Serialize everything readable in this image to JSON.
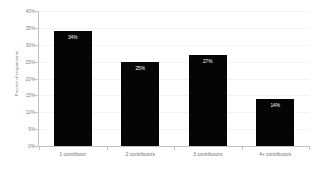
{
  "chart_data": {
    "type": "bar",
    "title": "",
    "subtitle": "",
    "xlabel": "",
    "ylabel": "Percent of respondents",
    "categories": [
      "1 contributor",
      "2 contributors",
      "3 contributors",
      "4+ contributors"
    ],
    "values": [
      34,
      25,
      27,
      14
    ],
    "value_labels": [
      "34%",
      "25%",
      "27%",
      "14%"
    ],
    "ylim": [
      0,
      40
    ],
    "ytick_values": [
      0,
      5,
      10,
      15,
      20,
      25,
      30,
      35,
      40
    ],
    "ytick_labels": [
      "0%",
      "5%",
      "10%",
      "15%",
      "20%",
      "25%",
      "30%",
      "35%",
      "40%"
    ],
    "grid": true,
    "legend": false,
    "legend_position": "none",
    "bar_color": "#050505",
    "value_label_color": "#ffffff",
    "gridline_color": "#f4f4f4",
    "axis_color": "#c2c2c2",
    "tick_label_color": "#808080",
    "background_color": "#ffffff"
  }
}
